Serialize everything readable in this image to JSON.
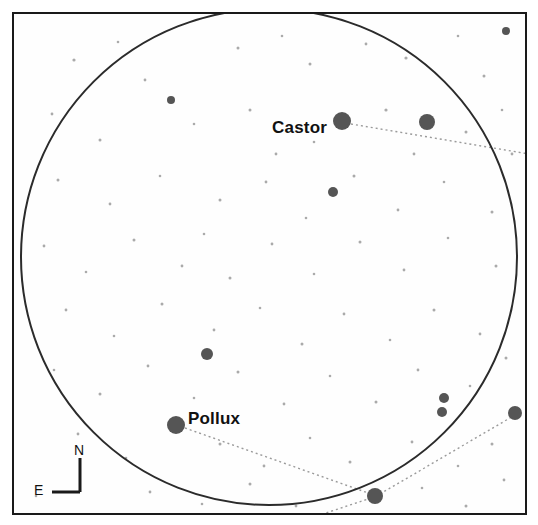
{
  "chart_data": {
    "type": "scatter",
    "xlabel": "",
    "ylabel": "",
    "grid": false,
    "legend_position": "none",
    "field_circle": {
      "cx": 255,
      "cy": 243,
      "r": 248
    },
    "labeled_stars": [
      {
        "name": "Castor",
        "x": 328,
        "y": 107,
        "size": 17
      },
      {
        "name": "Pollux",
        "x": 162,
        "y": 411,
        "size": 17
      }
    ],
    "bright_stars": [
      {
        "x": 328,
        "y": 107,
        "r": 9
      },
      {
        "x": 162,
        "y": 411,
        "r": 9
      },
      {
        "x": 413,
        "y": 108,
        "r": 8
      },
      {
        "x": 501,
        "y": 399,
        "r": 7
      },
      {
        "x": 361,
        "y": 482,
        "r": 8
      },
      {
        "x": 193,
        "y": 340,
        "r": 6
      },
      {
        "x": 430,
        "y": 384,
        "r": 5
      },
      {
        "x": 428,
        "y": 398,
        "r": 5
      },
      {
        "x": 319,
        "y": 178,
        "r": 5
      },
      {
        "x": 157,
        "y": 86,
        "r": 4
      },
      {
        "x": 492,
        "y": 17,
        "r": 4
      }
    ],
    "faint_stars": [
      {
        "x": 60,
        "y": 46,
        "r": 1.6
      },
      {
        "x": 104,
        "y": 28,
        "r": 1.3
      },
      {
        "x": 131,
        "y": 66,
        "r": 1.4
      },
      {
        "x": 224,
        "y": 34,
        "r": 1.5
      },
      {
        "x": 268,
        "y": 22,
        "r": 1.3
      },
      {
        "x": 296,
        "y": 50,
        "r": 1.5
      },
      {
        "x": 352,
        "y": 30,
        "r": 1.4
      },
      {
        "x": 392,
        "y": 44,
        "r": 1.6
      },
      {
        "x": 444,
        "y": 22,
        "r": 1.3
      },
      {
        "x": 470,
        "y": 62,
        "r": 1.5
      },
      {
        "x": 38,
        "y": 100,
        "r": 1.4
      },
      {
        "x": 86,
        "y": 126,
        "r": 1.5
      },
      {
        "x": 180,
        "y": 110,
        "r": 1.3
      },
      {
        "x": 236,
        "y": 96,
        "r": 1.5
      },
      {
        "x": 262,
        "y": 140,
        "r": 1.4
      },
      {
        "x": 300,
        "y": 128,
        "r": 1.3
      },
      {
        "x": 372,
        "y": 96,
        "r": 1.6
      },
      {
        "x": 400,
        "y": 140,
        "r": 1.4
      },
      {
        "x": 452,
        "y": 118,
        "r": 1.5
      },
      {
        "x": 488,
        "y": 96,
        "r": 1.3
      },
      {
        "x": 44,
        "y": 166,
        "r": 1.5
      },
      {
        "x": 96,
        "y": 190,
        "r": 1.4
      },
      {
        "x": 146,
        "y": 162,
        "r": 1.3
      },
      {
        "x": 206,
        "y": 186,
        "r": 1.5
      },
      {
        "x": 252,
        "y": 168,
        "r": 1.4
      },
      {
        "x": 292,
        "y": 204,
        "r": 1.3
      },
      {
        "x": 340,
        "y": 162,
        "r": 1.5
      },
      {
        "x": 384,
        "y": 196,
        "r": 1.4
      },
      {
        "x": 430,
        "y": 168,
        "r": 1.3
      },
      {
        "x": 478,
        "y": 198,
        "r": 1.5
      },
      {
        "x": 30,
        "y": 232,
        "r": 1.4
      },
      {
        "x": 72,
        "y": 258,
        "r": 1.3
      },
      {
        "x": 120,
        "y": 226,
        "r": 1.5
      },
      {
        "x": 168,
        "y": 252,
        "r": 1.4
      },
      {
        "x": 190,
        "y": 220,
        "r": 1.3
      },
      {
        "x": 216,
        "y": 264,
        "r": 1.5
      },
      {
        "x": 258,
        "y": 230,
        "r": 1.4
      },
      {
        "x": 300,
        "y": 260,
        "r": 1.3
      },
      {
        "x": 346,
        "y": 228,
        "r": 1.5
      },
      {
        "x": 390,
        "y": 256,
        "r": 1.4
      },
      {
        "x": 434,
        "y": 224,
        "r": 1.3
      },
      {
        "x": 482,
        "y": 252,
        "r": 1.5
      },
      {
        "x": 52,
        "y": 296,
        "r": 1.4
      },
      {
        "x": 100,
        "y": 322,
        "r": 1.3
      },
      {
        "x": 148,
        "y": 290,
        "r": 1.5
      },
      {
        "x": 200,
        "y": 316,
        "r": 1.4
      },
      {
        "x": 246,
        "y": 294,
        "r": 1.3
      },
      {
        "x": 288,
        "y": 330,
        "r": 1.5
      },
      {
        "x": 330,
        "y": 300,
        "r": 1.4
      },
      {
        "x": 376,
        "y": 326,
        "r": 1.3
      },
      {
        "x": 420,
        "y": 296,
        "r": 1.5
      },
      {
        "x": 466,
        "y": 320,
        "r": 1.4
      },
      {
        "x": 40,
        "y": 356,
        "r": 1.3
      },
      {
        "x": 86,
        "y": 380,
        "r": 1.5
      },
      {
        "x": 134,
        "y": 352,
        "r": 1.4
      },
      {
        "x": 180,
        "y": 384,
        "r": 1.3
      },
      {
        "x": 224,
        "y": 358,
        "r": 1.5
      },
      {
        "x": 270,
        "y": 390,
        "r": 1.4
      },
      {
        "x": 316,
        "y": 362,
        "r": 1.3
      },
      {
        "x": 362,
        "y": 388,
        "r": 1.5
      },
      {
        "x": 404,
        "y": 356,
        "r": 1.4
      },
      {
        "x": 456,
        "y": 372,
        "r": 1.3
      },
      {
        "x": 492,
        "y": 344,
        "r": 1.5
      },
      {
        "x": 64,
        "y": 420,
        "r": 1.4
      },
      {
        "x": 112,
        "y": 444,
        "r": 1.3
      },
      {
        "x": 206,
        "y": 430,
        "r": 1.5
      },
      {
        "x": 250,
        "y": 452,
        "r": 1.4
      },
      {
        "x": 296,
        "y": 424,
        "r": 1.3
      },
      {
        "x": 336,
        "y": 448,
        "r": 1.5
      },
      {
        "x": 398,
        "y": 428,
        "r": 1.4
      },
      {
        "x": 444,
        "y": 452,
        "r": 1.3
      },
      {
        "x": 478,
        "y": 430,
        "r": 1.5
      },
      {
        "x": 136,
        "y": 478,
        "r": 1.4
      },
      {
        "x": 188,
        "y": 490,
        "r": 1.3
      },
      {
        "x": 236,
        "y": 470,
        "r": 1.5
      },
      {
        "x": 282,
        "y": 492,
        "r": 1.4
      },
      {
        "x": 408,
        "y": 474,
        "r": 1.3
      },
      {
        "x": 452,
        "y": 492,
        "r": 1.5
      },
      {
        "x": 490,
        "y": 466,
        "r": 1.4
      },
      {
        "x": 22,
        "y": 482,
        "r": 1.3
      },
      {
        "x": 498,
        "y": 140,
        "r": 1.4
      }
    ],
    "constellation_lines": [
      {
        "from": "Castor",
        "x1": 337,
        "y1": 110,
        "x2": 515,
        "y2": 140
      },
      {
        "from": "Pollux",
        "x1": 171,
        "y1": 414,
        "x2": 357,
        "y2": 480
      },
      {
        "from": "bottom-star-left",
        "x1": 357,
        "y1": 484,
        "x2": 300,
        "y2": 503
      },
      {
        "from": "bottom-star-right",
        "x1": 366,
        "y1": 480,
        "x2": 501,
        "y2": 401
      }
    ]
  },
  "compass": {
    "north_label": "N",
    "east_label": "E"
  },
  "colors": {
    "background": "#ffffff",
    "frame": "#1a1a1a",
    "circle": "#2b2b2b",
    "star": "#555555",
    "faint_star": "#aaaaaa",
    "line": "#9a9a9a",
    "text": "#111111"
  }
}
